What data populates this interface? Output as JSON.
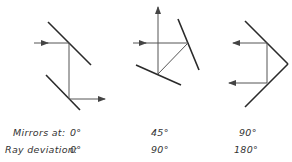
{
  "figure": {
    "diagrams": [
      {
        "mirror_angle": "0°",
        "ray_deviation": "0°"
      },
      {
        "mirror_angle": "45°",
        "ray_deviation": "90°"
      },
      {
        "mirror_angle": "90°",
        "ray_deviation": "180°"
      }
    ],
    "labels": {
      "row1_title": "Mirrors at:",
      "row2_title": "Ray deviation:",
      "row1_values": [
        "0°",
        "45°",
        "90°"
      ],
      "row2_values": [
        "0°",
        "90°",
        "180°"
      ]
    },
    "colors": {
      "mirror": "#2a2a2a",
      "ray": "#555555"
    }
  }
}
